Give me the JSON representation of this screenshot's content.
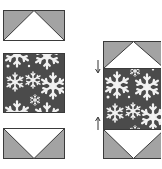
{
  "diagram": {
    "type": "quilt-block-assembly",
    "colors": {
      "background_triangle": "#a3a3a3",
      "goose_triangle": "#ffffff",
      "outline": "#3a3a3a",
      "snowflake_fabric": "#4b4b4b",
      "snowflake": "#f2f2f2",
      "arrow": "#333333"
    },
    "left_column": {
      "pieces": [
        {
          "name": "flying-geese-top",
          "goose_direction": "up"
        },
        {
          "name": "snowflake-rectangle",
          "fabric": "snowflake print"
        },
        {
          "name": "flying-geese-bottom",
          "goose_direction": "down"
        }
      ]
    },
    "right_column": {
      "pieces": [
        {
          "name": "flying-geese-top",
          "goose_direction": "up"
        },
        {
          "name": "snowflake-rectangle",
          "fabric": "snowflake print"
        },
        {
          "name": "flying-geese-bottom",
          "goose_direction": "down"
        }
      ],
      "arrows": [
        {
          "name": "seam-press-arrow-top",
          "direction": "down"
        },
        {
          "name": "seam-press-arrow-bottom",
          "direction": "up"
        }
      ]
    }
  }
}
